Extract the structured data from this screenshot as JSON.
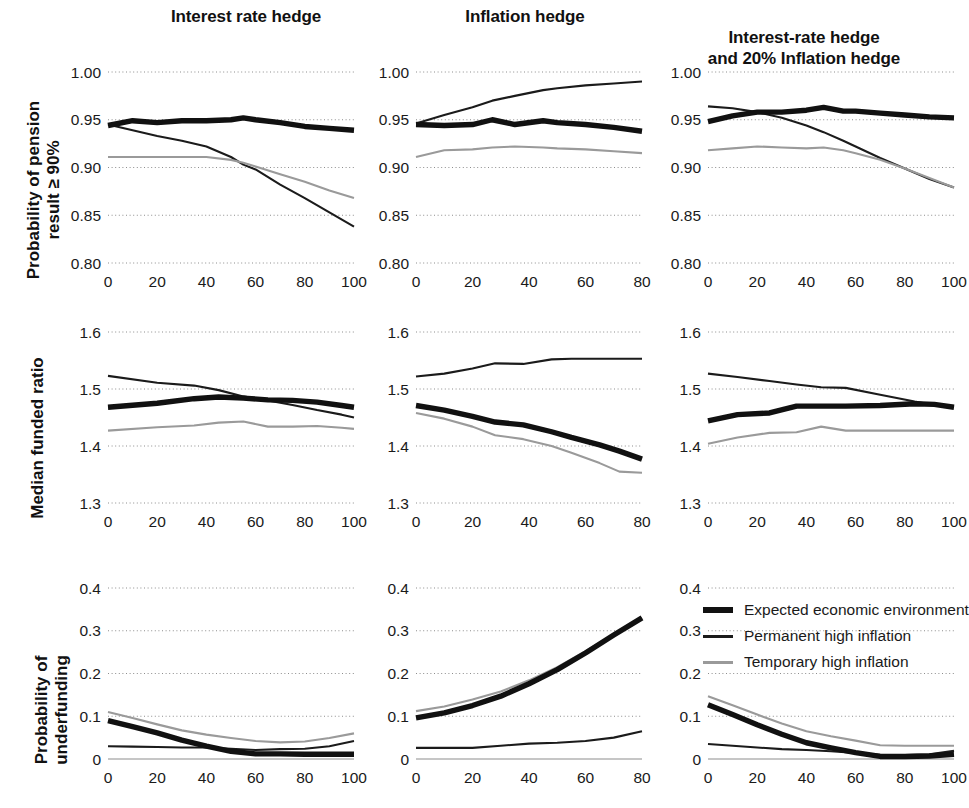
{
  "figure": {
    "column_titles": [
      "Interest rate hedge",
      "Inflation hedge",
      "Interest-rate hedge\nand 20% Inflation hedge"
    ],
    "row_labels": [
      "Probability of pension\nresult ≥ 90%",
      "Median funded ratio",
      "Probability of\nunderfunding"
    ]
  },
  "legend": {
    "title": "",
    "entries": [
      {
        "label": "Expected economic environment",
        "color": "#111111",
        "style": "thick"
      },
      {
        "label": "Permanent high inflation",
        "color": "#1b1b1b",
        "style": "thin"
      },
      {
        "label": "Temporary high inflation",
        "color": "#9a9a9a",
        "style": "grey"
      }
    ]
  },
  "chart_data": [
    {
      "id": "r1c1",
      "type": "line",
      "title": "Interest rate hedge",
      "xlabel": "",
      "ylabel": "Probability of pension result ≥ 90%",
      "xlim": [
        0,
        100
      ],
      "ylim": [
        0.8,
        1.0
      ],
      "xticks": [
        0,
        20,
        40,
        60,
        80,
        100
      ],
      "yticks": [
        0.8,
        0.85,
        0.9,
        0.95,
        1.0
      ],
      "ytick_labels": [
        "0.80",
        "0.85",
        "0.90",
        "0.95",
        "1.00"
      ],
      "grid": true,
      "x": [
        0,
        10,
        20,
        30,
        40,
        50,
        55,
        60,
        70,
        80,
        90,
        100
      ],
      "series": [
        {
          "name": "Expected economic environment",
          "values": [
            0.944,
            0.949,
            0.947,
            0.949,
            0.949,
            0.95,
            0.952,
            0.95,
            0.947,
            0.943,
            0.941,
            0.939
          ]
        },
        {
          "name": "Permanent high inflation",
          "values": [
            0.945,
            0.939,
            0.933,
            0.928,
            0.922,
            0.911,
            0.903,
            0.898,
            0.882,
            0.868,
            0.853,
            0.838
          ]
        },
        {
          "name": "Temporary high inflation",
          "values": [
            0.911,
            0.911,
            0.911,
            0.911,
            0.911,
            0.908,
            0.905,
            0.901,
            0.893,
            0.885,
            0.876,
            0.868
          ]
        }
      ]
    },
    {
      "id": "r1c2",
      "type": "line",
      "title": "Inflation hedge",
      "xlabel": "",
      "ylabel": "Probability of pension result ≥ 90%",
      "xlim": [
        0,
        80
      ],
      "ylim": [
        0.8,
        1.0
      ],
      "xticks": [
        0,
        20,
        40,
        60,
        80
      ],
      "yticks": [
        0.8,
        0.85,
        0.9,
        0.95,
        1.0
      ],
      "ytick_labels": [
        "0.80",
        "0.85",
        "0.90",
        "0.95",
        "1.00"
      ],
      "grid": true,
      "x": [
        0,
        10,
        20,
        27,
        35,
        45,
        50,
        60,
        70,
        80
      ],
      "series": [
        {
          "name": "Expected economic environment",
          "values": [
            0.945,
            0.944,
            0.945,
            0.95,
            0.945,
            0.949,
            0.947,
            0.945,
            0.942,
            0.938
          ]
        },
        {
          "name": "Permanent high inflation",
          "values": [
            0.946,
            0.955,
            0.963,
            0.97,
            0.975,
            0.981,
            0.983,
            0.986,
            0.988,
            0.99
          ]
        },
        {
          "name": "Temporary high inflation",
          "values": [
            0.911,
            0.918,
            0.919,
            0.921,
            0.922,
            0.921,
            0.92,
            0.919,
            0.917,
            0.915
          ]
        }
      ]
    },
    {
      "id": "r1c3",
      "type": "line",
      "title": "Interest-rate hedge and 20% Inflation hedge",
      "xlabel": "",
      "ylabel": "Probability of pension result ≥ 90%",
      "xlim": [
        0,
        100
      ],
      "ylim": [
        0.8,
        1.0
      ],
      "xticks": [
        0,
        20,
        40,
        60,
        80,
        100
      ],
      "yticks": [
        0.8,
        0.85,
        0.9,
        0.95,
        1.0
      ],
      "ytick_labels": [
        "0.80",
        "0.85",
        "0.90",
        "0.95",
        "1.00"
      ],
      "grid": true,
      "x": [
        0,
        10,
        20,
        30,
        40,
        47,
        55,
        60,
        70,
        80,
        90,
        100
      ],
      "series": [
        {
          "name": "Expected economic environment",
          "values": [
            0.948,
            0.954,
            0.958,
            0.958,
            0.96,
            0.963,
            0.959,
            0.959,
            0.957,
            0.955,
            0.953,
            0.952
          ]
        },
        {
          "name": "Permanent high inflation",
          "values": [
            0.964,
            0.962,
            0.958,
            0.952,
            0.944,
            0.937,
            0.928,
            0.922,
            0.91,
            0.899,
            0.888,
            0.879
          ]
        },
        {
          "name": "Temporary high inflation",
          "values": [
            0.918,
            0.92,
            0.922,
            0.921,
            0.92,
            0.921,
            0.918,
            0.915,
            0.908,
            0.899,
            0.889,
            0.879
          ]
        }
      ]
    },
    {
      "id": "r2c1",
      "type": "line",
      "title": "Interest rate hedge",
      "xlabel": "",
      "ylabel": "Median funded ratio",
      "xlim": [
        0,
        100
      ],
      "ylim": [
        1.3,
        1.6
      ],
      "xticks": [
        0,
        20,
        40,
        60,
        80,
        100
      ],
      "yticks": [
        1.3,
        1.4,
        1.5,
        1.6
      ],
      "ytick_labels": [
        "1.3",
        "1.4",
        "1.5",
        "1.6"
      ],
      "grid": true,
      "x": [
        0,
        20,
        35,
        45,
        55,
        65,
        75,
        85,
        95,
        100
      ],
      "series": [
        {
          "name": "Expected economic environment",
          "values": [
            1.468,
            1.475,
            1.483,
            1.486,
            1.484,
            1.481,
            1.48,
            1.477,
            1.471,
            1.468
          ]
        },
        {
          "name": "Permanent high inflation",
          "values": [
            1.523,
            1.511,
            1.506,
            1.498,
            1.487,
            1.48,
            1.472,
            1.463,
            1.455,
            1.45
          ]
        },
        {
          "name": "Temporary high inflation",
          "values": [
            1.427,
            1.433,
            1.436,
            1.441,
            1.443,
            1.434,
            1.434,
            1.435,
            1.432,
            1.43
          ]
        }
      ]
    },
    {
      "id": "r2c2",
      "type": "line",
      "title": "Inflation hedge",
      "xlabel": "",
      "ylabel": "Median funded ratio",
      "xlim": [
        0,
        80
      ],
      "ylim": [
        1.3,
        1.6
      ],
      "xticks": [
        0,
        20,
        40,
        60,
        80
      ],
      "yticks": [
        1.3,
        1.4,
        1.5,
        1.6
      ],
      "ytick_labels": [
        "1.3",
        "1.4",
        "1.5",
        "1.6"
      ],
      "grid": true,
      "x": [
        0,
        10,
        20,
        28,
        38,
        48,
        55,
        65,
        72,
        80
      ],
      "series": [
        {
          "name": "Expected economic environment",
          "values": [
            1.471,
            1.463,
            1.452,
            1.442,
            1.437,
            1.425,
            1.415,
            1.402,
            1.391,
            1.377
          ]
        },
        {
          "name": "Permanent high inflation",
          "values": [
            1.522,
            1.527,
            1.536,
            1.545,
            1.544,
            1.552,
            1.553,
            1.553,
            1.553,
            1.553
          ]
        },
        {
          "name": "Temporary high inflation",
          "values": [
            1.458,
            1.448,
            1.434,
            1.419,
            1.412,
            1.4,
            1.388,
            1.37,
            1.355,
            1.353
          ]
        }
      ]
    },
    {
      "id": "r2c3",
      "type": "line",
      "title": "Interest-rate hedge and 20% Inflation hedge",
      "xlabel": "",
      "ylabel": "Median funded ratio",
      "xlim": [
        0,
        100
      ],
      "ylim": [
        1.3,
        1.6
      ],
      "xticks": [
        0,
        20,
        40,
        60,
        80,
        100
      ],
      "yticks": [
        1.3,
        1.4,
        1.5,
        1.6
      ],
      "ytick_labels": [
        "1.3",
        "1.4",
        "1.5",
        "1.6"
      ],
      "grid": true,
      "x": [
        0,
        12,
        25,
        36,
        46,
        56,
        70,
        84,
        92,
        100
      ],
      "series": [
        {
          "name": "Expected economic environment",
          "values": [
            1.444,
            1.455,
            1.458,
            1.47,
            1.47,
            1.47,
            1.471,
            1.474,
            1.473,
            1.468
          ]
        },
        {
          "name": "Permanent high inflation",
          "values": [
            1.527,
            1.521,
            1.514,
            1.508,
            1.503,
            1.502,
            1.49,
            1.478,
            1.472,
            1.468
          ]
        },
        {
          "name": "Temporary high inflation",
          "values": [
            1.404,
            1.415,
            1.423,
            1.424,
            1.434,
            1.427,
            1.427,
            1.427,
            1.427,
            1.427
          ]
        }
      ]
    },
    {
      "id": "r3c1",
      "type": "line",
      "title": "Interest rate hedge",
      "xlabel": "",
      "ylabel": "Probability of underfunding",
      "xlim": [
        0,
        100
      ],
      "ylim": [
        0,
        0.4
      ],
      "xticks": [
        0,
        20,
        40,
        60,
        80,
        100
      ],
      "yticks": [
        0,
        0.1,
        0.2,
        0.3,
        0.4
      ],
      "ytick_labels": [
        "0",
        "0.1",
        "0.2",
        "0.3",
        "0.4"
      ],
      "grid": true,
      "x": [
        0,
        10,
        20,
        30,
        40,
        50,
        60,
        70,
        80,
        90,
        100
      ],
      "series": [
        {
          "name": "Expected economic environment",
          "values": [
            0.09,
            0.076,
            0.061,
            0.044,
            0.03,
            0.018,
            0.012,
            0.012,
            0.011,
            0.011,
            0.011
          ]
        },
        {
          "name": "Permanent high inflation",
          "values": [
            0.03,
            0.029,
            0.028,
            0.027,
            0.027,
            0.024,
            0.021,
            0.023,
            0.024,
            0.03,
            0.042
          ]
        },
        {
          "name": "Temporary high inflation",
          "values": [
            0.11,
            0.096,
            0.081,
            0.067,
            0.057,
            0.049,
            0.042,
            0.039,
            0.041,
            0.049,
            0.06
          ]
        }
      ]
    },
    {
      "id": "r3c2",
      "type": "line",
      "title": "Inflation hedge",
      "xlabel": "",
      "ylabel": "Probability of underfunding",
      "xlim": [
        0,
        80
      ],
      "ylim": [
        0,
        0.4
      ],
      "xticks": [
        0,
        20,
        40,
        60,
        80
      ],
      "yticks": [
        0,
        0.1,
        0.2,
        0.3,
        0.4
      ],
      "ytick_labels": [
        "0",
        "0.1",
        "0.2",
        "0.3",
        "0.4"
      ],
      "grid": true,
      "x": [
        0,
        10,
        20,
        30,
        40,
        50,
        60,
        70,
        80
      ],
      "series": [
        {
          "name": "Expected economic environment",
          "values": [
            0.096,
            0.108,
            0.125,
            0.147,
            0.176,
            0.209,
            0.248,
            0.29,
            0.33
          ]
        },
        {
          "name": "Permanent high inflation",
          "values": [
            0.026,
            0.026,
            0.026,
            0.031,
            0.036,
            0.038,
            0.042,
            0.05,
            0.065
          ]
        },
        {
          "name": "Temporary high inflation",
          "values": [
            0.112,
            0.123,
            0.139,
            0.158,
            0.184,
            0.215,
            0.252,
            0.292,
            0.33
          ]
        }
      ]
    },
    {
      "id": "r3c3",
      "type": "line",
      "title": "Interest-rate hedge and 20% Inflation hedge",
      "xlabel": "",
      "ylabel": "Probability of underfunding",
      "xlim": [
        0,
        100
      ],
      "ylim": [
        0,
        0.4
      ],
      "xticks": [
        0,
        20,
        40,
        60,
        80,
        100
      ],
      "yticks": [
        0,
        0.1,
        0.2,
        0.3,
        0.4
      ],
      "ytick_labels": [
        "0",
        "0.1",
        "0.2",
        "0.3",
        "0.4"
      ],
      "grid": true,
      "x": [
        0,
        10,
        20,
        30,
        40,
        50,
        60,
        70,
        80,
        90,
        100
      ],
      "series": [
        {
          "name": "Expected economic environment",
          "values": [
            0.127,
            0.104,
            0.08,
            0.058,
            0.038,
            0.026,
            0.015,
            0.006,
            0.006,
            0.007,
            0.011
          ]
        },
        {
          "name": "Permanent high inflation",
          "values": [
            0.035,
            0.031,
            0.027,
            0.023,
            0.021,
            0.018,
            0.014,
            0.01,
            0.009,
            0.011,
            0.019
          ]
        },
        {
          "name": "Temporary high inflation",
          "values": [
            0.147,
            0.126,
            0.104,
            0.083,
            0.065,
            0.053,
            0.043,
            0.032,
            0.031,
            0.031,
            0.031
          ]
        }
      ]
    }
  ]
}
